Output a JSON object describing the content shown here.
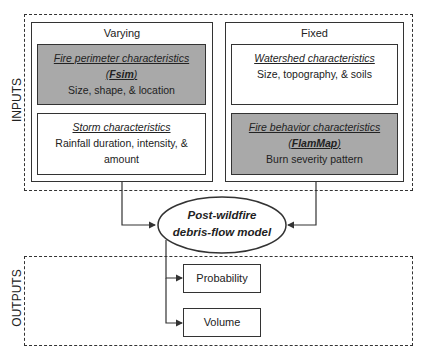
{
  "inputs": {
    "label": "INPUTS",
    "varying": {
      "label": "Varying",
      "fire_perimeter": {
        "title_pre": "Fire perimeter characteristics (",
        "title_bold": "Fsim",
        "title_post": ")",
        "desc": "Size, shape, & location"
      },
      "storm": {
        "title": "Storm characteristics",
        "desc": "Rainfall duration, intensity, & amount"
      }
    },
    "fixed": {
      "label": "Fixed",
      "watershed": {
        "title": "Watershed characteristics",
        "desc": "Size, topography, & soils"
      },
      "fire_behavior": {
        "title_pre": "Fire behavior characteristics (",
        "title_bold": "FlamMap",
        "title_post": ")",
        "desc": "Burn severity pattern"
      }
    }
  },
  "model": {
    "label": "Post-wildfire debris-flow model"
  },
  "outputs": {
    "label": "OUTPUTS",
    "items": [
      "Probability",
      "Volume"
    ]
  },
  "colors": {
    "shaded_box": "#a9a9a9",
    "line": "#333333"
  }
}
